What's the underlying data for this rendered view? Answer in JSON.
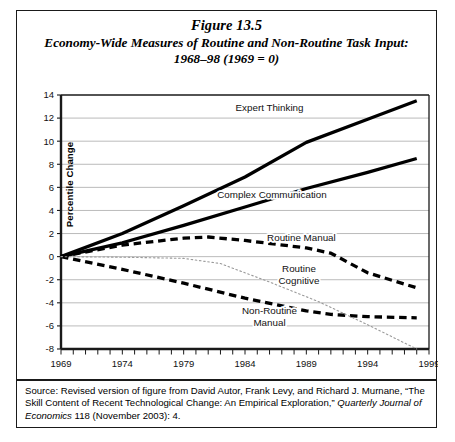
{
  "figure": {
    "number": "Figure 13.5",
    "title": "Economy-Wide Measures of Routine and Non-Routine Task Input: 1968–98 (1969 = 0)"
  },
  "source": {
    "prefix": "Source: Revised version of figure from David Autor, Frank Levy, and Richard J. Murnane, “The Skill Content of Recent Technological Change: An Empirical Exploration,” ",
    "journal": "Quarterly Journal of Economics",
    "suffix": " 118 (November 2003): 4."
  },
  "chart_data": {
    "type": "line",
    "title": "Economy-Wide Measures of Routine and Non-Routine Task Input: 1968–98 (1969 = 0)",
    "xlabel": "",
    "ylabel": "Percentile Change",
    "xlim": [
      1969,
      1999
    ],
    "ylim": [
      -8,
      14
    ],
    "ytick_step": 2,
    "yticks": [
      -8,
      -6,
      -4,
      -2,
      0,
      2,
      4,
      6,
      8,
      10,
      12,
      14
    ],
    "xticks_labeled": [
      1969,
      1974,
      1979,
      1984,
      1989,
      1994,
      1999
    ],
    "xtick_minor_step": 1,
    "grid": "horizontal",
    "legend": "inline-annotations",
    "series": [
      {
        "name": "Expert Thinking",
        "style": "solid-thick",
        "color": "#000000",
        "label_x": 1986.0,
        "label_y": 12.6,
        "x": [
          1969,
          1974,
          1979,
          1984,
          1989,
          1994,
          1998
        ],
        "y": [
          0,
          2.0,
          4.4,
          6.9,
          9.9,
          11.9,
          13.5
        ]
      },
      {
        "name": "Complex Communication",
        "style": "solid-thick",
        "color": "#000000",
        "label_x": 1986.2,
        "label_y": 5.1,
        "x": [
          1969,
          1974,
          1979,
          1984,
          1989,
          1994,
          1998
        ],
        "y": [
          0,
          1.2,
          2.7,
          4.3,
          5.9,
          7.3,
          8.5
        ]
      },
      {
        "name": "Routine Manual",
        "style": "dashed-thick",
        "color": "#000000",
        "label_x": 1988.6,
        "label_y": 1.35,
        "x": [
          1969,
          1974,
          1979,
          1981,
          1984,
          1989,
          1991,
          1994,
          1998
        ],
        "y": [
          0,
          1.0,
          1.6,
          1.7,
          1.4,
          0.75,
          0.3,
          -1.4,
          -2.7
        ]
      },
      {
        "name": "Non-Routine Manual",
        "style": "dashed-thick",
        "color": "#000000",
        "label_x": 1986.0,
        "label_y": -5.0,
        "x": [
          1969,
          1974,
          1979,
          1984,
          1989,
          1991,
          1994,
          1998
        ],
        "y": [
          0,
          -1.1,
          -2.3,
          -3.6,
          -4.7,
          -5.0,
          -5.2,
          -5.3
        ]
      },
      {
        "name": "Routine Cognitive",
        "style": "dotted-thin",
        "color": "#9a9a9a",
        "label_x": 1988.4,
        "label_y": -1.35,
        "x": [
          1969,
          1974,
          1979,
          1982,
          1986,
          1990,
          1994,
          1998
        ],
        "y": [
          0,
          -0.05,
          -0.15,
          -0.6,
          -2.2,
          -3.9,
          -5.9,
          -8.0
        ]
      }
    ],
    "series_label_lines": {
      "Routine Cognitive": [
        "Routine",
        "Cognitive"
      ],
      "Non-Routine Manual": [
        "Non-Routine",
        "Manual"
      ]
    }
  }
}
